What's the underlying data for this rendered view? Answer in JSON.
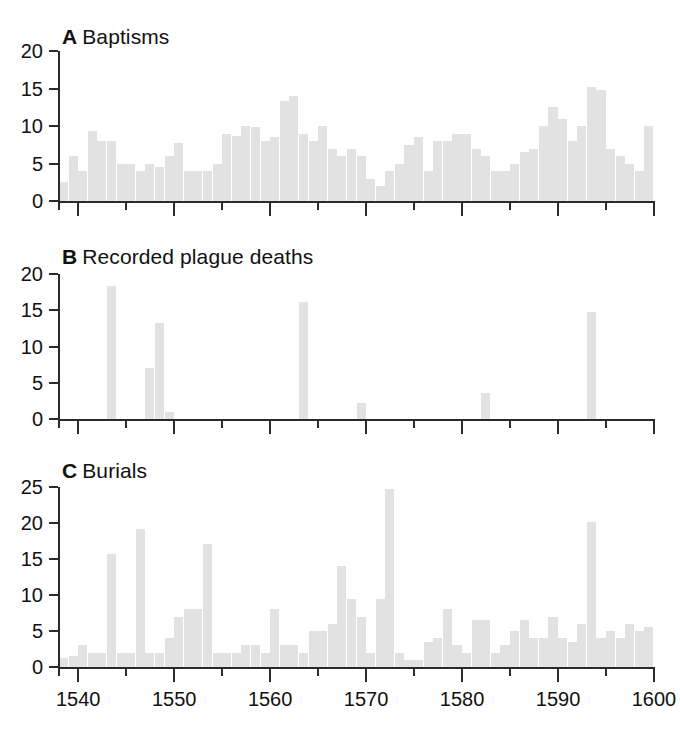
{
  "figure": {
    "background": "#ffffff",
    "bar_color": "#e2e2e2",
    "axis_color": "#2a2a2a",
    "text_color": "#111111"
  },
  "panels": [
    {
      "letter": "A",
      "title": "Baptisms",
      "ylim": [
        0,
        20
      ],
      "yticks": [
        "0",
        "5",
        "10",
        "15",
        "20"
      ]
    },
    {
      "letter": "B",
      "title": "Recorded plague deaths",
      "ylim": [
        0,
        20
      ],
      "yticks": [
        "0",
        "5",
        "10",
        "15",
        "20"
      ]
    },
    {
      "letter": "C",
      "title": "Burials",
      "ylim": [
        0,
        25
      ],
      "yticks": [
        "0",
        "5",
        "10",
        "15",
        "20",
        "25"
      ]
    }
  ],
  "xaxis": {
    "min": 1538,
    "max": 1600,
    "major_ticks": [
      1540,
      1550,
      1560,
      1570,
      1580,
      1590,
      1600
    ],
    "minor_ticks": [
      1545,
      1555,
      1565,
      1575,
      1585,
      1595
    ],
    "labels": [
      "1540",
      "1550",
      "1560",
      "1570",
      "1580",
      "1590",
      "1600"
    ]
  },
  "chart_data": [
    {
      "type": "bar",
      "title": "A Baptisms",
      "xlabel": "",
      "ylabel": "",
      "ylim": [
        0,
        20
      ],
      "xlim": [
        1538,
        1600
      ],
      "grid": false,
      "legend": "none",
      "x": [
        1538,
        1539,
        1540,
        1541,
        1542,
        1543,
        1544,
        1545,
        1546,
        1547,
        1548,
        1549,
        1550,
        1551,
        1552,
        1553,
        1554,
        1555,
        1556,
        1557,
        1558,
        1559,
        1560,
        1561,
        1562,
        1563,
        1564,
        1565,
        1566,
        1567,
        1568,
        1569,
        1570,
        1571,
        1572,
        1573,
        1574,
        1575,
        1576,
        1577,
        1578,
        1579,
        1580,
        1581,
        1582,
        1583,
        1584,
        1585,
        1586,
        1587,
        1588,
        1589,
        1590,
        1591,
        1592,
        1593,
        1594,
        1595,
        1596,
        1597,
        1598,
        1599,
        1600
      ],
      "values": [
        2.5,
        6,
        4,
        9.3,
        8,
        8,
        5,
        5,
        4,
        5,
        4.5,
        6,
        7.8,
        4,
        4,
        4,
        5,
        9,
        8.7,
        10,
        9.9,
        8,
        8.5,
        13.3,
        14,
        9,
        8,
        10,
        7,
        6,
        7,
        6,
        3,
        2,
        4,
        5,
        7.5,
        8.5,
        4,
        8,
        8,
        9,
        9,
        7,
        6,
        4,
        4,
        5,
        6.5,
        7,
        10,
        12.5,
        11,
        8,
        10,
        15.2,
        14.8,
        7,
        6,
        5,
        4,
        10,
        5
      ]
    },
    {
      "type": "bar",
      "title": "B Recorded plague deaths",
      "xlabel": "",
      "ylabel": "",
      "ylim": [
        0,
        20
      ],
      "xlim": [
        1538,
        1600
      ],
      "grid": false,
      "legend": "none",
      "x": [
        1543,
        1547,
        1548,
        1549,
        1563,
        1569,
        1582,
        1593
      ],
      "values": [
        18.3,
        7.0,
        13.3,
        1.0,
        16.2,
        2.2,
        3.6,
        14.7
      ]
    },
    {
      "type": "bar",
      "title": "C Burials",
      "xlabel": "",
      "ylabel": "",
      "ylim": [
        0,
        25
      ],
      "xlim": [
        1538,
        1600
      ],
      "grid": false,
      "legend": "none",
      "x": [
        1538,
        1539,
        1540,
        1541,
        1542,
        1543,
        1544,
        1545,
        1546,
        1547,
        1548,
        1549,
        1550,
        1551,
        1552,
        1553,
        1554,
        1555,
        1556,
        1557,
        1558,
        1559,
        1560,
        1561,
        1562,
        1563,
        1564,
        1565,
        1566,
        1567,
        1568,
        1569,
        1570,
        1571,
        1572,
        1573,
        1574,
        1575,
        1576,
        1577,
        1578,
        1579,
        1580,
        1581,
        1582,
        1583,
        1584,
        1585,
        1586,
        1587,
        1588,
        1589,
        1590,
        1591,
        1592,
        1593,
        1594,
        1595,
        1596,
        1597,
        1598,
        1599,
        1600
      ],
      "values": [
        1.2,
        1.5,
        3,
        2,
        2,
        15.7,
        2,
        2,
        19.2,
        2,
        2,
        4,
        7,
        8,
        8,
        17.1,
        2,
        2,
        2,
        3,
        3,
        2,
        8,
        3,
        3,
        2,
        5,
        5,
        6,
        14,
        9.5,
        7,
        2,
        9.5,
        24.7,
        2,
        1,
        1,
        3.5,
        4,
        8,
        3,
        2,
        6.5,
        6.5,
        2,
        3,
        5,
        6.5,
        4,
        4,
        7,
        4,
        3.5,
        6,
        20.1,
        4,
        5,
        4,
        6,
        5,
        5.5,
        6
      ]
    }
  ]
}
